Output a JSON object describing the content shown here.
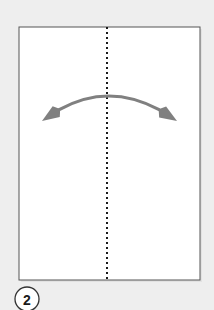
{
  "canvas": {
    "width": 214,
    "height": 310,
    "background_color": "#eeeeee"
  },
  "diagram": {
    "step_number": "2",
    "paper": {
      "name": "paper-sheet",
      "x": 19,
      "y": 27,
      "width": 181,
      "height": 253,
      "fill_color": "#ffffff",
      "border_color": "#555555",
      "border_width": 1
    },
    "fold_line": {
      "name": "vertical-fold-line",
      "orientation": "vertical",
      "x": 107,
      "y_start": 27,
      "y_end": 280,
      "style": "dashed",
      "color": "#1a1a1a",
      "dash_length": 2,
      "gap_length": 3,
      "stroke_width": 2
    },
    "arrow": {
      "name": "double-headed-fold-arrow",
      "type": "double-headed-curved",
      "color": "#808080",
      "stroke_width": 3.2,
      "left_tip": {
        "x": 42,
        "y": 121
      },
      "right_tip": {
        "x": 177,
        "y": 121
      },
      "apex": {
        "x": 108,
        "y": 96
      },
      "head_length": 17,
      "head_width": 13
    },
    "badge": {
      "name": "step-number-badge",
      "cx": 27,
      "cy": 299,
      "radius": 12,
      "fill_color": "#ffffff",
      "border_color": "#333333",
      "text_color": "#1a1a1a",
      "font_size": 14
    }
  }
}
